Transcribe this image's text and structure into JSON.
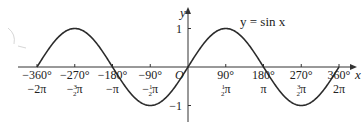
{
  "chart_data": {
    "type": "line",
    "title": "y = sin x",
    "xlabel": "x",
    "ylabel": "y",
    "xlim": [
      -360,
      370
    ],
    "ylim": [
      -1.5,
      1.5
    ],
    "grid": false,
    "origin_label": "O",
    "x_ticks_deg": [
      "−360°",
      "−270°",
      "−180°",
      "−90°",
      "90°",
      "180°",
      "270°",
      "360°"
    ],
    "x_ticks_rad": [
      "−2π",
      "−3/2π",
      "−π",
      "−1/2π",
      "1/2π",
      "π",
      "3/2π",
      "2π"
    ],
    "x_tick_values": [
      -360,
      -270,
      -180,
      -90,
      90,
      180,
      270,
      360
    ],
    "y_ticks": [
      "1",
      "−1"
    ],
    "y_tick_values": [
      1,
      -1
    ],
    "series": [
      {
        "name": "y = sin x",
        "x": [
          -360,
          -315,
          -270,
          -225,
          -180,
          -135,
          -90,
          -45,
          0,
          45,
          90,
          135,
          180,
          225,
          270,
          315,
          360
        ],
        "values": [
          0,
          0.707,
          1,
          0.707,
          0,
          -0.707,
          -1,
          -0.707,
          0,
          0.707,
          1,
          0.707,
          0,
          -0.707,
          -1,
          -0.707,
          0
        ]
      }
    ]
  }
}
